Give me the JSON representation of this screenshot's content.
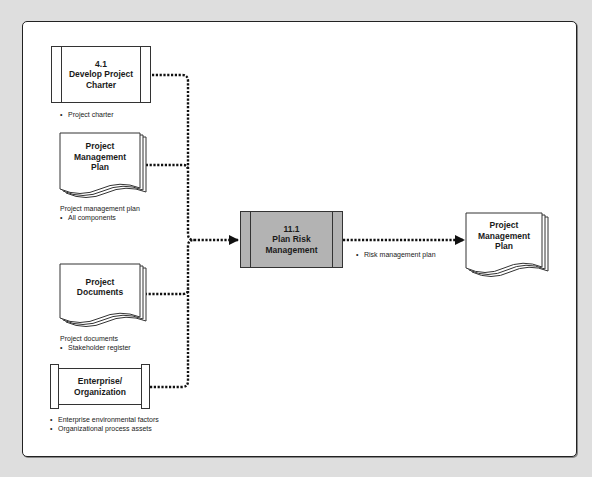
{
  "diagram": {
    "inputs": {
      "develop_charter": {
        "number": "4.1",
        "title_line1": "Develop Project",
        "title_line2": "Charter",
        "note_bullets": [
          "Project charter"
        ]
      },
      "pm_plan": {
        "title_line1": "Project",
        "title_line2": "Management",
        "title_line3": "Plan",
        "note_heading": "Project management plan",
        "note_bullets": [
          "All components"
        ]
      },
      "project_documents": {
        "title_line1": "Project",
        "title_line2": "Documents",
        "note_heading": "Project documents",
        "note_bullets": [
          "Stakeholder register"
        ]
      },
      "enterprise": {
        "title_line1": "Enterprise/",
        "title_line2": "Organization",
        "note_bullets": [
          "Enterprise environmental factors",
          "Organizational process assets"
        ]
      }
    },
    "process": {
      "number": "11.1",
      "title_line1": "Plan Risk",
      "title_line2": "Management",
      "fill_color": "#b3b3b3"
    },
    "output": {
      "title_line1": "Project",
      "title_line2": "Management",
      "title_line3": "Plan",
      "flow_label_bullets": [
        "Risk management plan"
      ]
    }
  }
}
